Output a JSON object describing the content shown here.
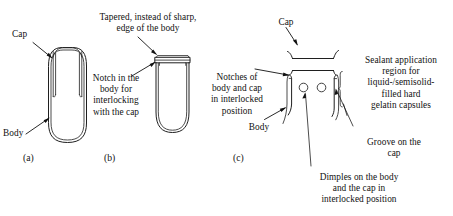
{
  "figure": {
    "background_color": "#ffffff",
    "ink_color": "#1a1a1a"
  },
  "panels": [
    {
      "marker": "(a)",
      "labels": [
        {
          "name": "cap",
          "text": "Cap"
        },
        {
          "name": "body",
          "text": "Body"
        }
      ]
    },
    {
      "marker": "(b)",
      "labels": [
        {
          "name": "tapered-edge",
          "text": "Tapered, instead of sharp,\nedge of the body"
        },
        {
          "name": "notch-in-body",
          "text": "Notch in the\nbody for\ninterlocking\nwith the cap"
        }
      ]
    },
    {
      "marker": "(c)",
      "labels": [
        {
          "name": "cap",
          "text": "Cap"
        },
        {
          "name": "notches-interlocked",
          "text": "Notches of\nbody and cap\nin interlocked\nposition"
        },
        {
          "name": "body",
          "text": "Body"
        },
        {
          "name": "sealant-region",
          "text": "Sealant application\nregion for\nliquid-/semisolid-\nfilled hard\ngelatin capsules"
        },
        {
          "name": "groove-on-cap",
          "text": "Groove on the\ncap"
        },
        {
          "name": "dimples",
          "text": "Dimples on the body\nand the cap in\ninterlocked position"
        }
      ]
    }
  ],
  "panel_a": {
    "marker": "(a)",
    "cap_label": "Cap",
    "body_label": "Body"
  },
  "panel_b": {
    "marker": "(b)",
    "tapered_label": "Tapered, instead of sharp,\nedge of the body",
    "notch_label": "Notch in the\nbody for\ninterlocking\nwith the cap"
  },
  "panel_c": {
    "marker": "(c)",
    "cap_label": "Cap",
    "notches_label": "Notches of\nbody and cap\nin interlocked\nposition",
    "body_label": "Body",
    "sealant_label": "Sealant application\nregion for\nliquid-/semisolid-\nfilled hard\ngelatin capsules",
    "groove_label": "Groove on the\ncap",
    "dimples_label": "Dimples on the body\nand the cap in\ninterlocked position"
  }
}
